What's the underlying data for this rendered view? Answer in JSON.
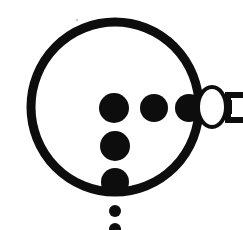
{
  "figure": {
    "type": "monochrome-line-diagram",
    "canvas": {
      "width": 243,
      "height": 230
    },
    "colors": {
      "background": "#ffffff",
      "ink": "#0d0d0d",
      "fill_white": "#ffffff"
    },
    "shapes": {
      "main_circle": {
        "name": "main-circle",
        "cx": 115,
        "cy": 107,
        "rx": 84,
        "ry": 85,
        "stroke_width": 9,
        "fill": "none"
      },
      "horizontal_dot_row": [
        {
          "name": "dot-row-1",
          "cx": 114,
          "cy": 108,
          "r": 15
        },
        {
          "name": "dot-row-2",
          "cx": 154,
          "cy": 108,
          "r": 14
        },
        {
          "name": "dot-row-3",
          "cx": 189,
          "cy": 108,
          "r": 14
        }
      ],
      "vertical_dot_column": [
        {
          "name": "dot-col-1",
          "cx": 114,
          "cy": 108,
          "r": 15
        },
        {
          "name": "dot-col-2",
          "cx": 115,
          "cy": 146,
          "r": 15
        },
        {
          "name": "dot-col-3",
          "cx": 115,
          "cy": 182,
          "r": 14
        },
        {
          "name": "dot-col-4",
          "cx": 115,
          "cy": 211,
          "r": 6
        },
        {
          "name": "dot-col-5",
          "cx": 115,
          "cy": 229,
          "r": 6
        }
      ],
      "terminal_ellipse": {
        "name": "terminal-ellipse",
        "cx": 212,
        "cy": 107,
        "rx": 14,
        "ry": 20,
        "stroke_width": 4,
        "fill": "#ffffff"
      },
      "bracket": {
        "name": "right-bracket",
        "x": 226,
        "y": 93,
        "width": 17,
        "height": 29,
        "stroke_width": 5
      },
      "speck": {
        "name": "stray-speck",
        "cx": 77,
        "cy": 20,
        "r": 1
      }
    }
  }
}
